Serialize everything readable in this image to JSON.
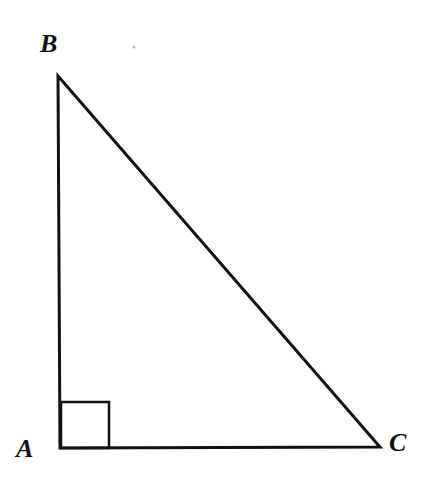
{
  "diagram": {
    "type": "right-triangle",
    "stroke_color": "#111111",
    "background": "#ffffff",
    "vertices": {
      "A": {
        "label": "A",
        "x": 60,
        "y": 448
      },
      "B": {
        "label": "B",
        "x": 58,
        "y": 76
      },
      "C": {
        "label": "C",
        "x": 380,
        "y": 447
      }
    },
    "right_angle_at": "A",
    "right_angle_marker_size": 49
  }
}
